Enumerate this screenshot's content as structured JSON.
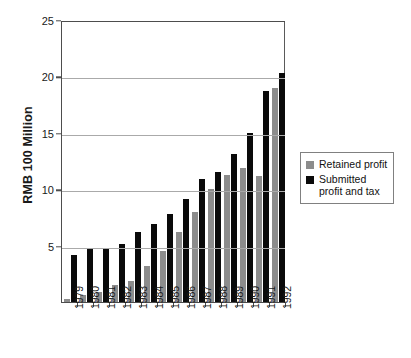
{
  "chart_data": {
    "type": "bar",
    "title": "",
    "xlabel": "",
    "ylabel": "RMB 100 Million",
    "ylim": [
      0,
      25
    ],
    "yticks": [
      0,
      5,
      10,
      15,
      20,
      25
    ],
    "ytick_labels": [
      "",
      "5",
      "10",
      "15",
      "20",
      "25"
    ],
    "grid": true,
    "legend_position": "right",
    "categories": [
      "1979",
      "1980",
      "1981",
      "1982",
      "1983",
      "1984",
      "1985",
      "1986",
      "1987",
      "1988",
      "1989",
      "1990",
      "1991",
      "1992"
    ],
    "series": [
      {
        "name": "Retained profit",
        "color": "#8c8c8c",
        "values": [
          0.3,
          0.6,
          0.9,
          1.5,
          1.9,
          3.2,
          4.5,
          6.2,
          8.0,
          10.0,
          11.3,
          11.9,
          11.2,
          19.0
        ]
      },
      {
        "name": "Submitted profit and tax",
        "color": "#0a0a0a",
        "values": [
          4.2,
          4.7,
          4.7,
          5.1,
          6.2,
          6.9,
          7.8,
          9.1,
          10.9,
          11.5,
          13.1,
          15.0,
          18.7,
          20.3
        ]
      }
    ]
  },
  "legend": {
    "items": [
      {
        "label": "Retained profit",
        "color": "#8c8c8c"
      },
      {
        "label": "Submitted profit and tax",
        "color": "#0a0a0a"
      }
    ]
  },
  "axis": {
    "y_title": "RMB 100 Million"
  }
}
